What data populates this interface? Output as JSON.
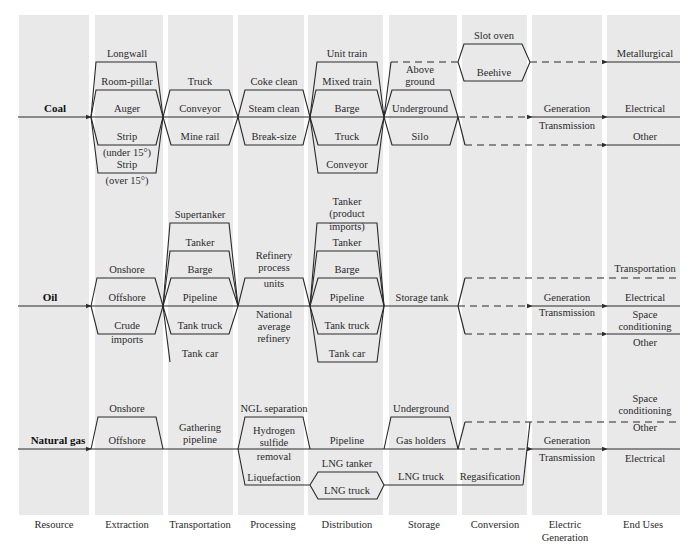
{
  "stages": [
    "Resource",
    "Extraction",
    "Transportation",
    "Processing",
    "Distribution",
    "Storage",
    "Conversion",
    "Electric",
    "End Uses"
  ],
  "stage_sub": {
    "electric": "Generation"
  },
  "resources": {
    "coal": {
      "name": "Coal",
      "extraction": [
        "Longwall",
        "Room-pillar",
        "Auger",
        "Strip",
        "(under 15°)",
        "Strip",
        "(over 15°)"
      ],
      "transportation": [
        "Truck",
        "Conveyor",
        "Mine rail"
      ],
      "processing": [
        "Coke clean",
        "Steam clean",
        "Break-size"
      ],
      "distribution": [
        "Unit train",
        "Mixed train",
        "Barge",
        "Truck",
        "Conveyor"
      ],
      "storage": [
        "Above",
        "ground",
        "Underground",
        "Silo"
      ],
      "conversion": [
        "Slot oven",
        "Beehive"
      ],
      "electric": [
        "Generation",
        "Transmission"
      ],
      "end_uses": [
        "Metallurgical",
        "Electrical",
        "Other"
      ]
    },
    "oil": {
      "name": "Oil",
      "extraction": [
        "Onshore",
        "Offshore",
        "Crude",
        "imports"
      ],
      "transportation": [
        "Supertanker",
        "Tanker",
        "Barge",
        "Pipeline",
        "Tank truck",
        "Tank car"
      ],
      "processing": [
        "Refinery",
        "process",
        "units",
        "National",
        "average",
        "refinery"
      ],
      "distribution": [
        "Tanker",
        "(product",
        "imports)",
        "Tanker",
        "Barge",
        "Pipeline",
        "Tank truck",
        "Tank car"
      ],
      "storage": [
        "Storage tank"
      ],
      "electric": [
        "Generation",
        "Transmission"
      ],
      "end_uses": [
        "Transportation",
        "Electrical",
        "Space",
        "conditioning",
        "Other"
      ]
    },
    "gas": {
      "name": "Natural gas",
      "extraction": [
        "Onshore",
        "Offshore"
      ],
      "transportation": [
        "Gathering",
        "pipeline"
      ],
      "processing": [
        "NGL separation",
        "Hydrogen",
        "sulfide",
        "removal",
        "Liquefaction"
      ],
      "distribution": [
        "Pipeline",
        "LNG tanker",
        "LNG truck"
      ],
      "storage": [
        "Underground",
        "Gas holders",
        "LNG truck"
      ],
      "conversion": [
        "Regasification"
      ],
      "electric": [
        "Generation",
        "Transmission"
      ],
      "end_uses": [
        "Space",
        "conditioning",
        "Other",
        "Electrical"
      ]
    }
  }
}
